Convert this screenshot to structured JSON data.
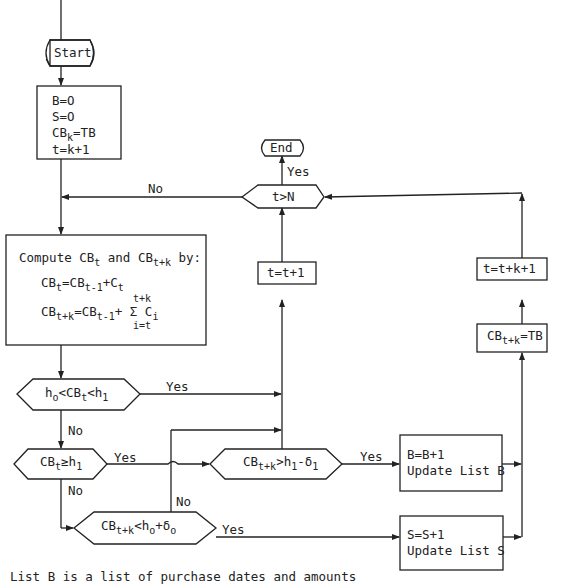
{
  "flowchart": {
    "start": "Start",
    "end": "End",
    "init": {
      "lines": [
        "B=O",
        "S=O",
        "CB",
        "k",
        "=TB",
        "t=k+1"
      ]
    },
    "compute": {
      "title_a": "Compute CB",
      "title_sub_t": "t",
      "title_and": " and CB",
      "title_sub_tk": "t+k",
      "title_by": " by:",
      "eq1_a": "CB",
      "eq1_sub": "t",
      "eq1_b": "=CB",
      "eq1_sub2": "t-1",
      "eq1_c": "+C",
      "eq1_sub3": "t",
      "eq2_top": "t+k",
      "eq2_a": "CB",
      "eq2_sub": "t+k",
      "eq2_b": "=CB",
      "eq2_sub2": "t-1",
      "eq2_c": "+ Σ C",
      "eq2_sub3": "i",
      "eq2_bottom": "i=t"
    },
    "decisions": {
      "t_gt_N": "t>N",
      "range": {
        "a": "h",
        "s1": "o",
        "b": "<CB",
        "s2": "t",
        "c": "<h",
        "s3": "1"
      },
      "cb_ge_h1": {
        "a": "CB",
        "s1": "t",
        "b": "≥h",
        "s2": "1"
      },
      "cbtk_gt": {
        "a": "CB",
        "s1": "t+k",
        "b": ">h",
        "s2": "1",
        "c": "-δ",
        "s3": "1"
      },
      "cbtk_lt": {
        "a": "CB",
        "s1": "t+k",
        "b": "<h",
        "s2": "o",
        "c": "+δ",
        "s3": "o"
      }
    },
    "processes": {
      "t_inc": "t=t+1",
      "t_inc_k": "t=t+k+1",
      "cbtk_tb": {
        "a": "CB",
        "s1": "t+k",
        "b": "=TB"
      },
      "buy": [
        "B=B+1",
        "Update List B"
      ],
      "sell": [
        "S=S+1",
        "Update List S"
      ]
    },
    "edge_labels": {
      "no_loop": "No",
      "yes_end": "Yes",
      "yes_range": "Yes",
      "no_range": "No",
      "yes_ge": "Yes",
      "no_ge": "No",
      "yes_buy": "Yes",
      "no_lt": "No",
      "yes_sell": "Yes"
    },
    "footnote": "List B is a list of purchase dates and amounts"
  }
}
